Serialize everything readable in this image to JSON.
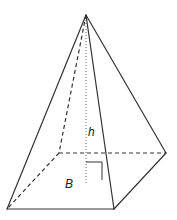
{
  "figure": {
    "type": "square pyramid",
    "labels": {
      "height": "h",
      "base": "B"
    },
    "colors": {
      "edge": "#333333",
      "height_line": "#666666",
      "background": "#ffffff"
    }
  }
}
